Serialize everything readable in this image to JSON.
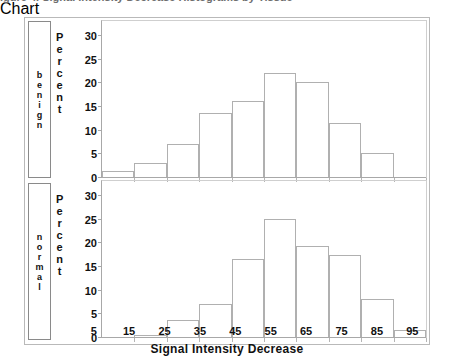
{
  "figure": {
    "truncated_header_text": "igure  4.  Signal  Intensity  Decrease  Histograms  by  Tissue",
    "x_axis_title": "Signal  Intensity  Decrease",
    "y_axis_title": "Percent",
    "y_axis_title_letters": [
      "P",
      "e",
      "r",
      "c",
      "e",
      "n",
      "t"
    ],
    "row_labels": [
      {
        "name": "benign",
        "letters": [
          "b",
          "e",
          "n",
          "i",
          "g",
          "n"
        ]
      },
      {
        "name": "normal",
        "letters": [
          "n",
          "o",
          "r",
          "m",
          "a",
          "l"
        ]
      }
    ],
    "y_ticks": [
      0,
      5,
      10,
      15,
      20,
      25,
      30
    ],
    "x_ticks": [
      5,
      15,
      25,
      35,
      45,
      55,
      65,
      75,
      85,
      95
    ],
    "x_bin_edges": [
      0,
      10,
      20,
      30,
      40,
      50,
      60,
      70,
      80,
      90,
      100
    ],
    "colors": {
      "frame": "#b9b9b9",
      "axis": "#a8a8a8",
      "bar_outline": "#b0b0b0",
      "text": "#111111",
      "label_box_border": "#8a8a8a"
    }
  },
  "chart_data": [
    {
      "type": "bar",
      "title": "benign",
      "xlabel": "Signal  Intensity  Decrease",
      "ylabel": "Percent",
      "ylim": [
        0,
        33
      ],
      "xlim": [
        0,
        100
      ],
      "grid": false,
      "legend": "none",
      "categories": [
        "5",
        "15",
        "25",
        "35",
        "45",
        "55",
        "65",
        "75",
        "85",
        "95"
      ],
      "bin_edges": [
        0,
        10,
        20,
        30,
        40,
        50,
        60,
        70,
        80,
        90,
        100
      ],
      "values": [
        1.3,
        3.0,
        7.0,
        13.5,
        16.0,
        22.0,
        20.0,
        11.5,
        5.0,
        0.0
      ],
      "ytick_labels": [
        "0",
        "5",
        "10",
        "15",
        "20",
        "25",
        "30"
      ]
    },
    {
      "type": "bar",
      "title": "normal",
      "xlabel": "Signal  Intensity  Decrease",
      "ylabel": "Percent",
      "ylim": [
        0,
        33
      ],
      "xlim": [
        0,
        100
      ],
      "grid": false,
      "legend": "none",
      "categories": [
        "5",
        "15",
        "25",
        "35",
        "45",
        "55",
        "65",
        "75",
        "85",
        "95"
      ],
      "bin_edges": [
        0,
        10,
        20,
        30,
        40,
        50,
        60,
        70,
        80,
        90,
        100
      ],
      "values": [
        0.0,
        0.5,
        3.5,
        7.0,
        16.5,
        25.0,
        19.3,
        17.3,
        8.0,
        1.5
      ],
      "ytick_labels": [
        "0",
        "5",
        "10",
        "15",
        "20",
        "25",
        "30"
      ]
    }
  ]
}
